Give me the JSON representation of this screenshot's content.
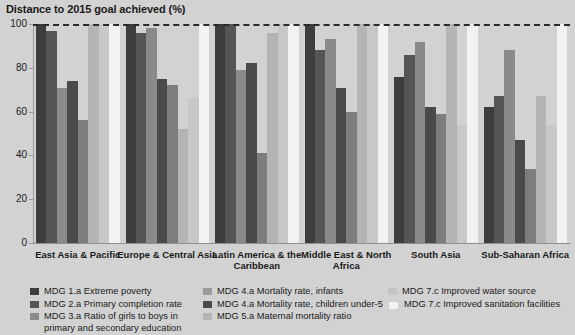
{
  "chart_data": {
    "type": "bar",
    "title": "Distance to 2015 goal achieved (%)",
    "xlabel": "",
    "ylabel": "",
    "ylim": [
      0,
      100
    ],
    "yticks": [
      0,
      20,
      40,
      60,
      80,
      100
    ],
    "grid": false,
    "legend_position": "bottom",
    "reference_line": {
      "value": 100,
      "style": "dashed",
      "color": "#2a2a2a"
    },
    "categories": [
      "East Asia & Pacific",
      "Europe & Central Asia",
      "Latin America & the Caribbean",
      "Middle East & North Africa",
      "South Asia",
      "Sub-Saharan Africa"
    ],
    "series": [
      {
        "name": "MDG 1.a Extreme poverty",
        "color": "#3d3d3d",
        "values": [
          100,
          100,
          100,
          100,
          76,
          62
        ]
      },
      {
        "name": "MDG 2.a Primary completion rate",
        "color": "#555555",
        "values": [
          97,
          96,
          100,
          88,
          86,
          67
        ]
      },
      {
        "name": "MDG 3.a Ratio of girls to boys in primary and secondary education",
        "color": "#8a8a8a",
        "values": [
          71,
          98,
          79,
          93,
          92,
          88
        ]
      },
      {
        "name": "MDG 4.a Mortality rate, infants",
        "color": "#4a4a4a",
        "values": [
          74,
          75,
          82,
          71,
          62,
          47
        ]
      },
      {
        "name": "MDG 4.a Mortality rate, children under-5",
        "color": "#7d7d7d",
        "values": [
          56,
          72,
          41,
          60,
          59,
          34
        ]
      },
      {
        "name": "MDG 5.a Maternal mortality ratio",
        "color": "#b4b4b4",
        "values": [
          100,
          52,
          96,
          100,
          100,
          67
        ]
      },
      {
        "name": "MDG 7.c Improved water source",
        "color": "#c8c8c8",
        "values": [
          100,
          66,
          100,
          100,
          54,
          54
        ]
      },
      {
        "name": "MDG 7.c Improved sanitation facilities",
        "color": "#f2f2f2",
        "values": [
          100,
          100,
          100,
          100,
          100,
          100
        ]
      }
    ]
  },
  "axis": {
    "ticks": [
      "100",
      "80",
      "60",
      "40",
      "20",
      "0"
    ]
  },
  "legend": {
    "col1": [
      {
        "label": "MDG 1.a Extreme poverty",
        "color": "#3d3d3d"
      },
      {
        "label": "MDG 2.a Primary completion rate",
        "color": "#555555"
      },
      {
        "label": "MDG 3.a Ratio of girls to boys in primary and secondary education",
        "color": "#8a8a8a"
      }
    ],
    "col2": [
      {
        "label": "MDG 4.a Mortality rate, infants",
        "color": "#9b9b9b"
      },
      {
        "label": "MDG 4.a Mortality rate, children under-5",
        "color": "#4a4a4a"
      },
      {
        "label": "MDG 5.a Maternal mortality ratio",
        "color": "#b4b4b4"
      }
    ],
    "col3": [
      {
        "label": "MDG 7.c Improved water source",
        "color": "#c4c4c4"
      },
      {
        "label": "MDG 7.c Improved sanitation facilities",
        "color": "#f2f2f2"
      }
    ]
  }
}
